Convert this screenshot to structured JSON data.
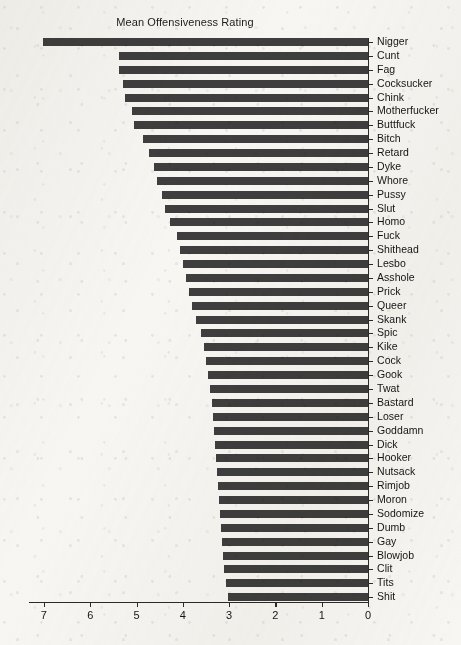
{
  "chart_data": {
    "type": "bar",
    "orientation": "horizontal",
    "title": "Mean Offensiveness Rating",
    "xlabel": "",
    "ylabel": "",
    "xlim": [
      7,
      0
    ],
    "x_axis_reversed": true,
    "grid": false,
    "legend": null,
    "bar_color": "#3e3e3e",
    "background_color": "#f7f6f3",
    "xticks": [
      7,
      6,
      5,
      4,
      3,
      2,
      1,
      0
    ],
    "xtick_labels": [
      "7",
      "6",
      "5",
      "4",
      "3",
      "2",
      "1",
      "0"
    ],
    "categories": [
      "Nigger",
      "Cunt",
      "Fag",
      "Cocksucker",
      "Chink",
      "Motherfucker",
      "Buttfuck",
      "Bitch",
      "Retard",
      "Dyke",
      "Whore",
      "Pussy",
      "Slut",
      "Homo",
      "Fuck",
      "Shithead",
      "Lesbo",
      "Asshole",
      "Prick",
      "Queer",
      "Skank",
      "Spic",
      "Kike",
      "Cock",
      "Gook",
      "Twat",
      "Bastard",
      "Loser",
      "Goddamn",
      "Dick",
      "Hooker",
      "Nutsack",
      "Rimjob",
      "Moron",
      "Sodomize",
      "Dumb",
      "Gay",
      "Blowjob",
      "Clit",
      "Tits",
      "Shit"
    ],
    "values": [
      7.02,
      5.38,
      5.38,
      5.29,
      5.24,
      5.1,
      5.06,
      4.87,
      4.73,
      4.62,
      4.55,
      4.45,
      4.38,
      4.28,
      4.13,
      4.07,
      4.0,
      3.93,
      3.87,
      3.8,
      3.71,
      3.6,
      3.55,
      3.5,
      3.46,
      3.42,
      3.38,
      3.35,
      3.33,
      3.3,
      3.28,
      3.26,
      3.24,
      3.22,
      3.2,
      3.18,
      3.16,
      3.14,
      3.1,
      3.07,
      3.03
    ]
  }
}
